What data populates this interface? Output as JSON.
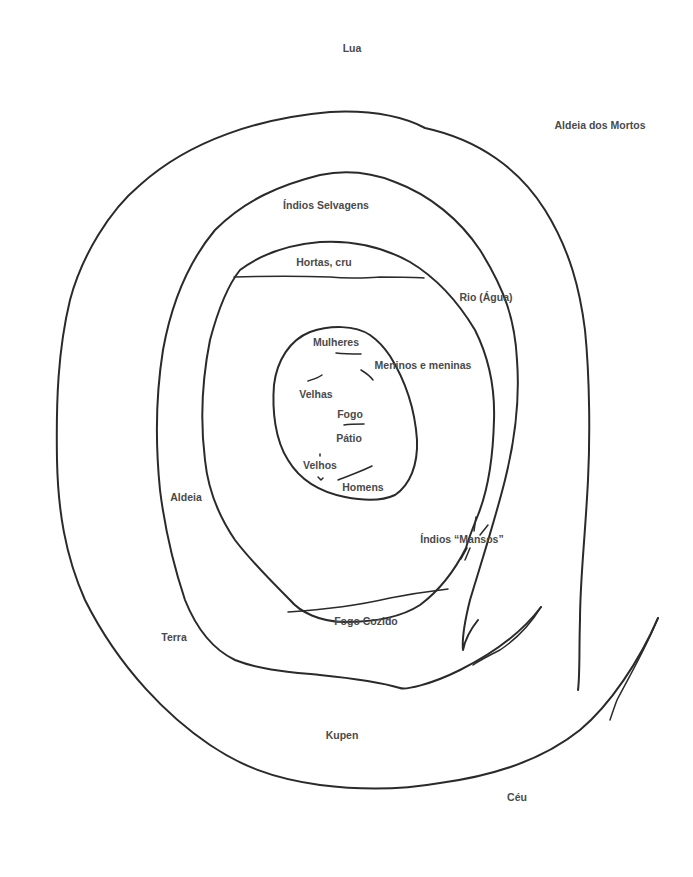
{
  "diagram": {
    "type": "concentric-cosmology-map",
    "stroke_color": "#2a2a2a",
    "text_color": "#4a4a4a",
    "background": "#ffffff",
    "labels": {
      "top": "Lua",
      "bottom": "Sol",
      "outer_ring_label": "Aldeia dos Mortos",
      "outer_ring_left": "Terra",
      "outer_ring_right": "Céu",
      "between_outer_and_second": "Kupen",
      "second_ring_top": "Índios Selvagens",
      "second_ring_right": "Rio (Água)",
      "third_ring_top": "Hortas, cru",
      "third_ring_left": "Aldeia",
      "third_ring_right": "Índios “Mansos”",
      "third_ring_bottom": "Fogo Cozido",
      "inner_oval": {
        "top": "Mulheres",
        "top_right": "Meninos e meninas",
        "left": "Velhas",
        "center_top": "Fogo",
        "center": "Pátio",
        "bottom_left": "Velhos",
        "bottom": "Homens"
      }
    },
    "rings": [
      {
        "name": "outer-ring",
        "description": "Aldeia dos Mortos / Terra / Céu boundary"
      },
      {
        "name": "second-ring",
        "description": "Índios Selvagens / Kupen boundary"
      },
      {
        "name": "third-ring",
        "description": "Aldeia / Rio (Água) boundary"
      },
      {
        "name": "inner-oval",
        "description": "Pátio"
      }
    ]
  }
}
